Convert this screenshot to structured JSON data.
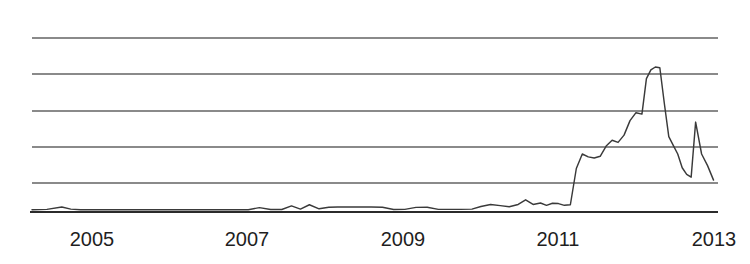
{
  "chart": {
    "title": "",
    "subtitle": "",
    "background_color": "#ffffff",
    "line_color": "#3a3a3a",
    "gridline_color": "#8a8a8a",
    "axis_color": "#2b2b2b",
    "tick_label_color": "#1f1f1f"
  },
  "chart_data": {
    "type": "line",
    "title": "",
    "xlabel": "",
    "ylabel": "",
    "xlim": [
      2004.1,
      2013.3
    ],
    "ylim": [
      0,
      120
    ],
    "grid": true,
    "grid_axis": "y",
    "gridline_values": [
      20,
      40,
      60,
      80,
      100
    ],
    "legend": false,
    "legend_position": "none",
    "x_tick_labels": [
      "2005",
      "2007",
      "2009",
      "2011",
      "2013"
    ],
    "x_tick_values": [
      2005,
      2007,
      2009,
      2011,
      2013
    ],
    "y_tick_labels": [],
    "series": [
      {
        "name": "series-1",
        "x": [
          2004.1,
          2004.3,
          2004.5,
          2004.62,
          2004.75,
          2004.9,
          2005.05,
          2005.25,
          2005.45,
          2005.65,
          2005.85,
          2006.05,
          2006.25,
          2006.45,
          2006.65,
          2006.85,
          2007.0,
          2007.15,
          2007.3,
          2007.45,
          2007.58,
          2007.7,
          2007.82,
          2007.95,
          2008.08,
          2008.2,
          2008.35,
          2008.5,
          2008.65,
          2008.8,
          2008.95,
          2009.1,
          2009.25,
          2009.4,
          2009.55,
          2009.7,
          2009.85,
          2010.0,
          2010.12,
          2010.25,
          2010.38,
          2010.5,
          2010.62,
          2010.72,
          2010.82,
          2010.92,
          2011.0,
          2011.08,
          2011.16,
          2011.24,
          2011.32,
          2011.4,
          2011.48,
          2011.56,
          2011.64,
          2011.72,
          2011.8,
          2011.88,
          2011.96,
          2012.04,
          2012.12,
          2012.2,
          2012.28,
          2012.34,
          2012.4,
          2012.46,
          2012.52,
          2012.58,
          2012.64,
          2012.7,
          2012.76,
          2012.82,
          2012.88,
          2012.94,
          2013.0,
          2013.08,
          2013.16,
          2013.24
        ],
        "y": [
          1.5,
          1.8,
          3.5,
          2.0,
          1.6,
          1.5,
          1.5,
          1.5,
          1.5,
          1.5,
          1.5,
          1.5,
          1.6,
          1.5,
          1.5,
          1.6,
          1.6,
          3.0,
          1.7,
          1.7,
          4.2,
          2.0,
          5.0,
          2.2,
          3.3,
          3.4,
          3.4,
          3.4,
          3.4,
          3.3,
          1.7,
          1.8,
          3.2,
          3.3,
          1.8,
          1.8,
          1.8,
          2.0,
          3.8,
          5.2,
          4.4,
          3.6,
          5.2,
          8.4,
          5.2,
          6.2,
          4.6,
          6.0,
          5.8,
          4.6,
          5.0,
          30.0,
          40.0,
          38.0,
          37.2,
          38.4,
          45.5,
          49.5,
          48.0,
          53.0,
          63.0,
          68.5,
          67.5,
          92.0,
          98.0,
          100.0,
          99.5,
          75.0,
          52.0,
          46.0,
          40.0,
          30.5,
          26.0,
          24.0,
          62.0,
          40.0,
          32.0,
          22.0
        ]
      }
    ],
    "notes": {
      "pattern": "Near-zero baseline from 2004 through early 2011, then a steep rise beginning mid-2011, a primary peak in mid-2012 at the top gridline, a sharp decline, and a narrow secondary spike in late 2012 before settling.",
      "peak_x": 2012.46,
      "peak_label": "mid-2012",
      "secondary_peak_x": 2013.0,
      "secondary_peak_label": "late-2012"
    }
  },
  "layout": {
    "plot_left_px": 32,
    "plot_right_px": 718,
    "plot_top_px": 38,
    "baseline_px": 212,
    "gridline_y_px": [
      38,
      74,
      111,
      147,
      183
    ],
    "tick_label_y_px": 246,
    "tick_label_x_px": [
      92,
      247,
      403,
      558,
      714
    ]
  }
}
